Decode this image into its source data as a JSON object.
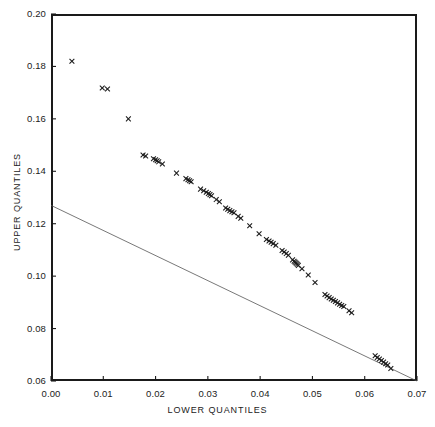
{
  "chart_data": {
    "type": "scatter",
    "title": "",
    "xlabel": "LOWER QUANTILES",
    "ylabel": "UPPER QUANTILES",
    "xlim": [
      0.0,
      0.07
    ],
    "ylim": [
      0.06,
      0.2
    ],
    "xticks": [
      0.0,
      0.01,
      0.02,
      0.03,
      0.04,
      0.05,
      0.06,
      0.07
    ],
    "xticklabels": [
      "0.00",
      "0.01",
      "0.02",
      "0.03",
      "0.04",
      "0.05",
      "0.06",
      "0.07"
    ],
    "yticks": [
      0.06,
      0.08,
      0.1,
      0.12,
      0.14,
      0.16,
      0.18,
      0.2
    ],
    "yticklabels": [
      "0.06",
      "0.08",
      "0.10",
      "0.12",
      "0.14",
      "0.16",
      "0.18",
      "0.20"
    ],
    "grid": false,
    "legend": null,
    "marker": "x",
    "marker_color": "#1a1a1a",
    "line_color": "#555555",
    "frame_color": "#1a1a1a",
    "reference_line": {
      "x": [
        0.0,
        0.07
      ],
      "y": [
        0.127,
        0.06
      ]
    },
    "x": [
      0.004,
      0.0098,
      0.0108,
      0.0148,
      0.0176,
      0.0181,
      0.0196,
      0.02,
      0.0203,
      0.0206,
      0.0213,
      0.024,
      0.0258,
      0.0262,
      0.0265,
      0.0268,
      0.0286,
      0.0292,
      0.0297,
      0.0301,
      0.0304,
      0.0307,
      0.0316,
      0.0322,
      0.0334,
      0.0338,
      0.0342,
      0.0346,
      0.035,
      0.0358,
      0.0363,
      0.038,
      0.0398,
      0.0412,
      0.0417,
      0.0421,
      0.0425,
      0.043,
      0.0442,
      0.0446,
      0.045,
      0.0454,
      0.0462,
      0.0465,
      0.0467,
      0.0469,
      0.0471,
      0.0473,
      0.048,
      0.0492,
      0.0505,
      0.0524,
      0.0528,
      0.0532,
      0.0536,
      0.054,
      0.0544,
      0.0548,
      0.0552,
      0.0556,
      0.056,
      0.057,
      0.0575,
      0.062,
      0.0624,
      0.0628,
      0.0632,
      0.0636,
      0.064,
      0.0644,
      0.065
    ],
    "y": [
      0.182,
      0.1718,
      0.1714,
      0.16,
      0.1462,
      0.1458,
      0.1448,
      0.1444,
      0.144,
      0.1436,
      0.1428,
      0.1393,
      0.1372,
      0.1368,
      0.1364,
      0.136,
      0.1332,
      0.1326,
      0.132,
      0.1315,
      0.1311,
      0.1307,
      0.1292,
      0.1284,
      0.126,
      0.1255,
      0.125,
      0.1246,
      0.1242,
      0.1228,
      0.1221,
      0.1192,
      0.1162,
      0.114,
      0.1134,
      0.1129,
      0.1124,
      0.1118,
      0.1098,
      0.1092,
      0.1086,
      0.108,
      0.1062,
      0.1057,
      0.1053,
      0.1049,
      0.1045,
      0.1041,
      0.1028,
      0.1004,
      0.0976,
      0.093,
      0.0924,
      0.0918,
      0.0913,
      0.0908,
      0.0903,
      0.0898,
      0.0893,
      0.0888,
      0.0884,
      0.0868,
      0.086,
      0.0696,
      0.069,
      0.0684,
      0.0678,
      0.0672,
      0.0666,
      0.0661,
      0.0648
    ]
  },
  "axes": {
    "x_title": "LOWER QUANTILES",
    "y_title": "UPPER QUANTILES"
  }
}
